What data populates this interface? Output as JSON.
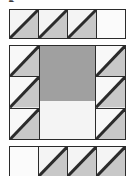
{
  "figure": {
    "name": "quilt-block-diagram",
    "partial_label": "g",
    "colors": {
      "background": "#ffffff",
      "light_patch": "#f4f4f4",
      "medium_patch": "#c8c8c8",
      "center_patch": "#a0a0a0",
      "outline": "#2b2b2b"
    }
  },
  "top_strip": {
    "name": "top-flying-geese-strip",
    "units": [
      {
        "label": "half-square-triangle",
        "fill": "#c8c8c8",
        "diagonal": "bottom-left-to-top-right",
        "shaded_half": "lower-right"
      },
      {
        "label": "half-square-triangle",
        "fill": "#c8c8c8",
        "diagonal": "bottom-left-to-top-right",
        "shaded_half": "lower-right"
      },
      {
        "label": "half-square-triangle",
        "fill": "#c8c8c8",
        "diagonal": "bottom-left-to-top-right",
        "shaded_half": "lower-right"
      },
      {
        "label": "plain-square",
        "fill": "#f4f4f4",
        "diagonal": "none",
        "shaded_half": "none"
      }
    ]
  },
  "middle_block": {
    "name": "center-block",
    "left_column": {
      "name": "left-triangle-column",
      "units": [
        {
          "label": "half-square-triangle",
          "fill": "#c8c8c8",
          "diagonal": "bottom-left-to-top-right",
          "shaded_half": "lower-right"
        },
        {
          "label": "half-square-triangle",
          "fill": "#c8c8c8",
          "diagonal": "bottom-left-to-top-right",
          "shaded_half": "lower-right"
        },
        {
          "label": "half-square-triangle",
          "fill": "#c8c8c8",
          "diagonal": "bottom-left-to-top-right",
          "shaded_half": "lower-right"
        }
      ]
    },
    "center": {
      "label": "center-square",
      "fill": "#a0a0a0"
    },
    "right_column": {
      "name": "right-triangle-column",
      "units": [
        {
          "label": "half-square-triangle",
          "fill": "#c8c8c8",
          "diagonal": "bottom-left-to-top-right",
          "shaded_half": "lower-right"
        },
        {
          "label": "half-square-triangle",
          "fill": "#c8c8c8",
          "diagonal": "bottom-left-to-top-right",
          "shaded_half": "lower-right"
        },
        {
          "label": "half-square-triangle",
          "fill": "#c8c8c8",
          "diagonal": "bottom-left-to-top-right",
          "shaded_half": "lower-right"
        }
      ]
    }
  },
  "bottom_strip": {
    "name": "bottom-flying-geese-strip",
    "units": [
      {
        "label": "plain-square",
        "fill": "#f4f4f4",
        "diagonal": "none",
        "shaded_half": "none"
      },
      {
        "label": "half-square-triangle",
        "fill": "#c8c8c8",
        "diagonal": "bottom-left-to-top-right",
        "shaded_half": "lower-right"
      },
      {
        "label": "half-square-triangle",
        "fill": "#c8c8c8",
        "diagonal": "bottom-left-to-top-right",
        "shaded_half": "lower-right"
      },
      {
        "label": "half-square-triangle",
        "fill": "#c8c8c8",
        "diagonal": "bottom-left-to-top-right",
        "shaded_half": "lower-right"
      }
    ]
  }
}
